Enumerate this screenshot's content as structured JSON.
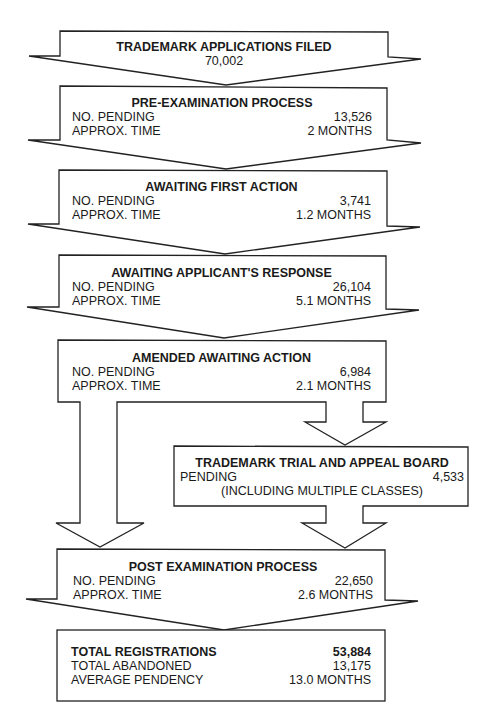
{
  "diagram": {
    "stages": [
      {
        "id": "filed",
        "title": "TRADEMARK APPLICATIONS FILED",
        "value": "70,002"
      },
      {
        "id": "pre_exam",
        "title": "PRE-EXAMINATION PROCESS",
        "rows": [
          {
            "label": "NO. PENDING",
            "value": "13,526"
          },
          {
            "label": "APPROX. TIME",
            "value": "2 MONTHS"
          }
        ]
      },
      {
        "id": "first_action",
        "title": "AWAITING FIRST ACTION",
        "rows": [
          {
            "label": "NO. PENDING",
            "value": "3,741"
          },
          {
            "label": "APPROX. TIME",
            "value": "1.2 MONTHS"
          }
        ]
      },
      {
        "id": "applicant_response",
        "title": "AWAITING APPLICANT'S RESPONSE",
        "rows": [
          {
            "label": "NO. PENDING",
            "value": "26,104"
          },
          {
            "label": "APPROX. TIME",
            "value": "5.1 MONTHS"
          }
        ]
      },
      {
        "id": "amended",
        "title": "AMENDED AWAITING ACTION",
        "rows": [
          {
            "label": "NO. PENDING",
            "value": "6,984"
          },
          {
            "label": "APPROX. TIME",
            "value": "2.1 MONTHS"
          }
        ]
      },
      {
        "id": "ttab",
        "title": "TRADEMARK TRIAL AND APPEAL BOARD",
        "rows": [
          {
            "label": "PENDING",
            "value": "4,533"
          }
        ],
        "note": "(INCLUDING MULTIPLE CLASSES)"
      },
      {
        "id": "post_exam",
        "title": "POST EXAMINATION PROCESS",
        "rows": [
          {
            "label": "NO. PENDING",
            "value": "22,650"
          },
          {
            "label": "APPROX. TIME",
            "value": "2.6 MONTHS"
          }
        ]
      }
    ],
    "summary": {
      "rows": [
        {
          "label": "TOTAL REGISTRATIONS",
          "value": "53,884"
        },
        {
          "label": "TOTAL ABANDONED",
          "value": "13,175"
        },
        {
          "label": "AVERAGE PENDENCY",
          "value": "13.0 MONTHS"
        }
      ]
    }
  }
}
